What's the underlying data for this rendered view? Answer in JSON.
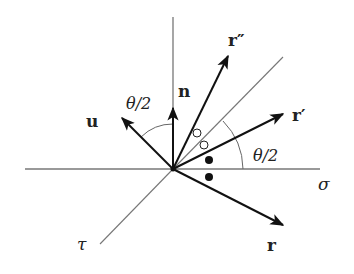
{
  "diagram": {
    "origin": [
      173,
      169
    ],
    "axes": {
      "sigma_label": "σ",
      "tau_label": "τ"
    },
    "vectors": [
      {
        "name": "r",
        "label": "r"
      },
      {
        "name": "r-prime",
        "label": "r′"
      },
      {
        "name": "r-double-prime",
        "label": "r″"
      },
      {
        "name": "n",
        "label": "n"
      },
      {
        "name": "u",
        "label": "u"
      }
    ],
    "angles": [
      {
        "name": "angle-u-n",
        "label": "θ/2"
      },
      {
        "name": "angle-sigma-rprime",
        "label": "θ/2"
      }
    ],
    "markers": {
      "open_circles": 2,
      "filled_dots": 2
    }
  }
}
